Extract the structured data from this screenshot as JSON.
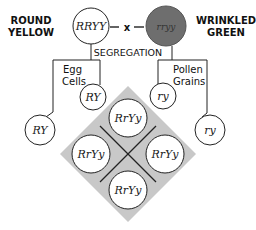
{
  "parents": {
    "left": {
      "phenotype_line1": "ROUND",
      "phenotype_line2": "YELLOW",
      "genotype": "RRYY",
      "fill": "#ffffff"
    },
    "right": {
      "phenotype_line1": "WRINKLED",
      "phenotype_line2": "GREEN",
      "genotype": "rryy",
      "fill": "#6e6e6e"
    },
    "cross_symbol": "x"
  },
  "segregation_label": "SEGREGATION",
  "gametes": {
    "left_label_line1": "Egg",
    "left_label_line2": "Cells",
    "left_inner": "RY",
    "left_outer": "RY",
    "right_label_line1": "Pollen",
    "right_label_line2": "Grains",
    "right_inner": "ry",
    "right_outer": "ry"
  },
  "offspring": {
    "grid_fill": "#c8c8c8",
    "cells": [
      "RrYy",
      "RrYy",
      "RrYy",
      "RrYy"
    ]
  }
}
